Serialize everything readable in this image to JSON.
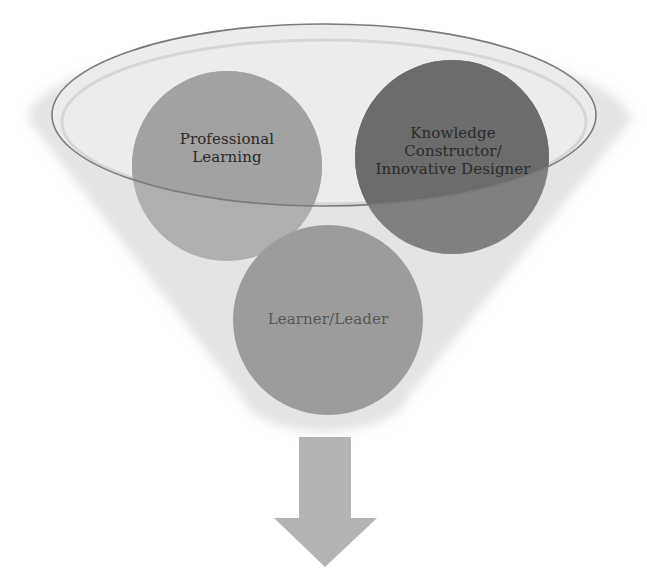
{
  "diagram": {
    "type": "funnel",
    "circles": [
      {
        "id": "professional-learning",
        "lines": [
          "Professional",
          "Learning"
        ],
        "color": "#a8a8a8",
        "color_in_rim": "#9c9c9c"
      },
      {
        "id": "knowledge-constructor",
        "lines": [
          "Knowledge",
          "Constructor/",
          "Innovative Designer"
        ],
        "color": "#7f7f7f",
        "color_in_rim": "#6a6a6a"
      },
      {
        "id": "learner-leader",
        "lines": [
          "Learner/Leader"
        ],
        "color": "#9b9b9b"
      }
    ],
    "funnel_color": "#e2e2e2",
    "rim_stroke": "#7a7a7a",
    "arrow": {
      "direction": "down",
      "color": "#b3b3b3"
    }
  }
}
